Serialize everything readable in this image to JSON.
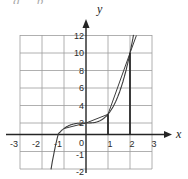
{
  "artifact": {
    "clipped_text": "g p"
  },
  "chart_data": {
    "type": "line",
    "title": "",
    "origin_label": "0",
    "grid": true,
    "x_axis": {
      "label": "x",
      "range": [
        -3,
        3
      ],
      "gridlines": [
        -3,
        -2,
        -1,
        0,
        1,
        2,
        3
      ],
      "ticks": [
        -3,
        -2,
        -1,
        1,
        2,
        3
      ],
      "tick_labels": [
        "-3",
        "-2",
        "-1",
        "1",
        "2",
        "3"
      ]
    },
    "y_axis": {
      "label": "y",
      "range": [
        -2,
        12
      ],
      "tick_values": [
        12,
        10,
        8,
        6,
        4,
        2,
        -1,
        -2
      ],
      "tick_labels": [
        "12",
        "10",
        "8",
        "6",
        "4",
        "2",
        "-1",
        "-2"
      ]
    },
    "key_points": [
      [
        -1,
        1
      ],
      [
        0,
        2
      ],
      [
        1,
        3
      ],
      [
        2,
        10
      ]
    ],
    "series": [
      {
        "name": "cubic-curve",
        "label": "y = x^3 + 2",
        "fn": {
          "type": "poly",
          "coeffs": [
            2,
            0,
            0,
            1
          ]
        },
        "domain": [
          -1.59,
          2.16
        ],
        "color": "#3c3c3c",
        "width": 1.1
      },
      {
        "name": "secant-polyline",
        "label": "secant segments",
        "points": [
          [
            -1,
            1
          ],
          [
            0,
            2
          ],
          [
            1,
            3
          ],
          [
            2,
            10
          ],
          [
            2.29,
            12
          ]
        ],
        "color": "#3c3c3c",
        "width": 1.0
      },
      {
        "name": "vertical-segment-x1",
        "label": "vertical segment at x=1",
        "points": [
          [
            1,
            0
          ],
          [
            1,
            3
          ]
        ],
        "color": "#2a2a2a",
        "width": 1.8
      },
      {
        "name": "vertical-segment-x2",
        "label": "vertical segment at x=2",
        "points": [
          [
            2,
            0
          ],
          [
            2,
            10
          ]
        ],
        "color": "#2a2a2a",
        "width": 1.8
      }
    ]
  }
}
